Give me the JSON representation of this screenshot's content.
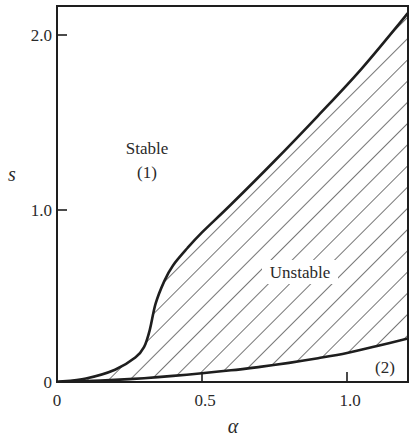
{
  "chart_data": {
    "type": "area",
    "title": "",
    "xlabel": "α",
    "ylabel": "s",
    "xlim": [
      0,
      1.21
    ],
    "ylim": [
      0,
      2.16
    ],
    "grid": false,
    "legend": null,
    "x_ticks": [
      {
        "value": 0,
        "label": "0"
      },
      {
        "value": 0.5,
        "label": "0.5"
      },
      {
        "value": 1.0,
        "label": "1.0"
      }
    ],
    "y_ticks": [
      {
        "value": 0,
        "label": "0"
      },
      {
        "value": 1.0,
        "label": "1.0"
      },
      {
        "value": 2.0,
        "label": "2.0"
      }
    ],
    "series": [
      {
        "name": "upper boundary",
        "x": [
          0,
          0.1,
          0.2,
          0.27,
          0.3,
          0.32,
          0.34,
          0.37,
          0.4,
          0.45,
          0.5,
          0.6,
          0.75,
          0.9,
          1.05,
          1.21
        ],
        "y": [
          0,
          0.02,
          0.07,
          0.14,
          0.2,
          0.3,
          0.45,
          0.58,
          0.67,
          0.77,
          0.86,
          1.02,
          1.27,
          1.53,
          1.8,
          2.12
        ]
      },
      {
        "name": "lower boundary",
        "x": [
          0,
          0.1,
          0.2,
          0.3,
          0.4,
          0.5,
          0.6,
          0.7,
          0.8,
          0.9,
          1.0,
          1.1,
          1.21
        ],
        "y": [
          0,
          0.005,
          0.012,
          0.022,
          0.035,
          0.05,
          0.067,
          0.087,
          0.11,
          0.137,
          0.167,
          0.205,
          0.25
        ]
      }
    ],
    "regions": [
      {
        "name": "Stable",
        "label": "Stable",
        "sublabel": "(1)",
        "x": 0.32,
        "y": 1.3,
        "fill": "none"
      },
      {
        "name": "Unstable",
        "label": "Unstable",
        "x": 0.8,
        "y": 0.62,
        "fill": "diagonal-hatch"
      },
      {
        "name": "Region 2",
        "label": "(2)",
        "x": 1.13,
        "y": 0.06,
        "fill": "none"
      }
    ],
    "annotations": [
      "Stable",
      "(1)",
      "Unstable",
      "(2)"
    ]
  },
  "labels": {
    "stable": "Stable",
    "stable_num": "(1)",
    "unstable": "Unstable",
    "region2": "(2)",
    "xlabel": "α",
    "ylabel": "s",
    "xtick0": "0",
    "xtick1": "0.5",
    "xtick2": "1.0",
    "ytick0": "0",
    "ytick1": "1.0",
    "ytick2": "2.0"
  },
  "colors": {
    "ink": "#1e1e1e",
    "background": "#ffffff"
  }
}
